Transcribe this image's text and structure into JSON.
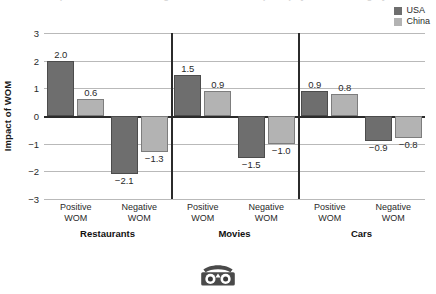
{
  "figure": {
    "title_fragment": "Impact of Positive and Negative Word of Mouth (WOM) by Product Category",
    "logo_name": "owl-logo"
  },
  "legend": {
    "position": "top-right",
    "entries": [
      {
        "label": "USA",
        "color": "#6e6e6e"
      },
      {
        "label": "China",
        "color": "#b3b3b3"
      }
    ]
  },
  "axes": {
    "ylabel": "Impact of WOM",
    "yticks": [
      "3",
      "2",
      "1",
      "0",
      "−1",
      "−2",
      "−3"
    ],
    "ytick_values": [
      3,
      2,
      1,
      0,
      -1,
      -2,
      -3
    ],
    "ylim": [
      -3,
      3
    ],
    "xtick_line1": "Positive",
    "xtick_line2": "WOM",
    "xtick_neg_line1": "Negative",
    "xtick_neg_line2": "WOM"
  },
  "chart_data": {
    "type": "bar",
    "title": "Impact of Positive and Negative Word of Mouth (WOM) by Product Category",
    "xlabel": "",
    "ylabel": "Impact of WOM",
    "ylim": [
      -3,
      3
    ],
    "grid": true,
    "legend_position": "top-right",
    "groups": [
      "Restaurants",
      "Movies",
      "Cars"
    ],
    "subcategories": [
      "Positive WOM",
      "Negative WOM"
    ],
    "categories": [
      "Restaurants / Positive WOM",
      "Restaurants / Negative WOM",
      "Movies / Positive WOM",
      "Movies / Negative WOM",
      "Cars / Positive WOM",
      "Cars / Negative WOM"
    ],
    "series": [
      {
        "name": "USA",
        "color": "#6e6e6e",
        "values": [
          2.0,
          -2.1,
          1.5,
          -1.5,
          0.9,
          -0.9
        ],
        "labels": [
          "2.0",
          "−2.1",
          "1.5",
          "−1.5",
          "0.9",
          "−0.9"
        ]
      },
      {
        "name": "China",
        "color": "#b3b3b3",
        "values": [
          0.6,
          -1.3,
          0.9,
          -1.0,
          0.8,
          -0.8
        ],
        "labels": [
          "0.6",
          "−1.3",
          "0.9",
          "−1.0",
          "0.8",
          "−0.8"
        ]
      }
    ]
  }
}
